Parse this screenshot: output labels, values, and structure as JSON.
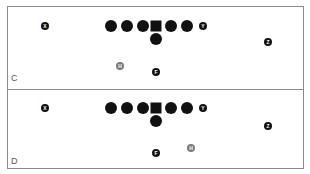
{
  "colors": {
    "player": "#111111",
    "highlight_player": "#7a7a7a",
    "border": "#8a8a8a"
  },
  "panels": [
    {
      "label": "C",
      "players": {
        "X": {
          "label": "X",
          "x": 37,
          "y": 19
        },
        "ol1": {
          "label": "",
          "x": 103,
          "y": 19
        },
        "ol2": {
          "label": "",
          "x": 119,
          "y": 19
        },
        "ol3": {
          "label": "",
          "x": 135,
          "y": 19
        },
        "center": {
          "label": "",
          "x": 148,
          "y": 19
        },
        "ol5": {
          "label": "",
          "x": 163,
          "y": 19
        },
        "ol6": {
          "label": "",
          "x": 179,
          "y": 19
        },
        "Y": {
          "label": "Y",
          "x": 195,
          "y": 19
        },
        "QB": {
          "label": "",
          "x": 148,
          "y": 32
        },
        "Z": {
          "label": "Z",
          "x": 260,
          "y": 35
        },
        "H": {
          "label": "H",
          "x": 112,
          "y": 59
        },
        "F": {
          "label": "F",
          "x": 148,
          "y": 65
        }
      }
    },
    {
      "label": "D",
      "players": {
        "X": {
          "label": "X",
          "x": 37,
          "y": 18
        },
        "ol1": {
          "label": "",
          "x": 103,
          "y": 18
        },
        "ol2": {
          "label": "",
          "x": 119,
          "y": 18
        },
        "ol3": {
          "label": "",
          "x": 135,
          "y": 18
        },
        "center": {
          "label": "",
          "x": 148,
          "y": 18
        },
        "ol5": {
          "label": "",
          "x": 163,
          "y": 18
        },
        "ol6": {
          "label": "",
          "x": 179,
          "y": 18
        },
        "Y": {
          "label": "Y",
          "x": 195,
          "y": 18
        },
        "QB": {
          "label": "",
          "x": 148,
          "y": 31
        },
        "Z": {
          "label": "Z",
          "x": 260,
          "y": 36
        },
        "H": {
          "label": "H",
          "x": 183,
          "y": 58
        },
        "F": {
          "label": "F",
          "x": 148,
          "y": 63
        }
      }
    }
  ]
}
